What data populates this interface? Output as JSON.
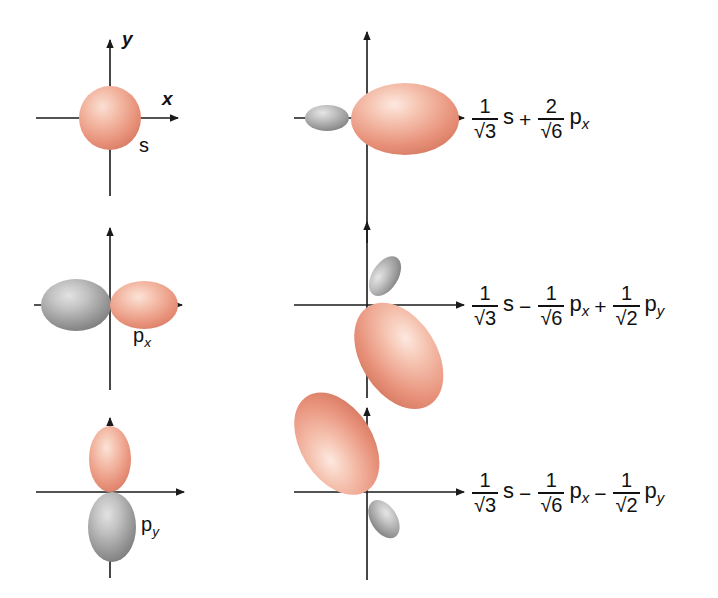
{
  "figure": {
    "background_color": "#ffffff",
    "colors": {
      "positive_lobe": "#e8917a",
      "positive_lobe_light": "#f7cdbd",
      "negative_lobe": "#8f8f8f",
      "negative_lobe_light": "#cfcfcf",
      "axis": "#1a1a1a",
      "text": "#111111"
    }
  },
  "axes": {
    "x_label": "x",
    "y_label": "y"
  },
  "left_column": {
    "panels": [
      {
        "name": "s-orbital",
        "label": "s",
        "label_sub": "",
        "shape": "sphere",
        "lobes": [
          {
            "sign": "positive",
            "color": "#e8917a",
            "direction": "all",
            "size": "medium"
          }
        ]
      },
      {
        "name": "px-orbital",
        "label": "p",
        "label_sub": "x",
        "shape": "dumbbell-horizontal",
        "lobes": [
          {
            "sign": "negative",
            "color": "#8f8f8f",
            "direction": "-x",
            "size": "medium"
          },
          {
            "sign": "positive",
            "color": "#e8917a",
            "direction": "+x",
            "size": "medium"
          }
        ]
      },
      {
        "name": "py-orbital",
        "label": "p",
        "label_sub": "y",
        "shape": "dumbbell-vertical",
        "lobes": [
          {
            "sign": "positive",
            "color": "#e8917a",
            "direction": "+y",
            "size": "medium"
          },
          {
            "sign": "negative",
            "color": "#8f8f8f",
            "direction": "-y",
            "size": "medium"
          }
        ]
      }
    ]
  },
  "right_column": {
    "panels": [
      {
        "name": "hybrid-orbital-1",
        "orientation_degrees": 0,
        "description": "Large positive lobe along +x, small negative lobe along -x",
        "lobes": [
          {
            "sign": "positive",
            "color": "#e8917a",
            "direction": "+x",
            "size": "large"
          },
          {
            "sign": "negative",
            "color": "#8f8f8f",
            "direction": "-x",
            "size": "small"
          }
        ],
        "equation": {
          "terms": [
            {
              "op": "",
              "numerator": "1",
              "denominator": "3",
              "radical": true,
              "orbital": "s",
              "orbital_sub": ""
            },
            {
              "op": "+",
              "numerator": "2",
              "denominator": "6",
              "radical": true,
              "orbital": "p",
              "orbital_sub": "x"
            }
          ]
        }
      },
      {
        "name": "hybrid-orbital-2",
        "orientation_degrees": 210,
        "description": "Large positive lobe pointing down-left, small negative lobe pointing up-right",
        "lobes": [
          {
            "sign": "positive",
            "color": "#e8917a",
            "direction": "down-left",
            "size": "large"
          },
          {
            "sign": "negative",
            "color": "#8f8f8f",
            "direction": "up-right",
            "size": "small"
          }
        ],
        "equation": {
          "terms": [
            {
              "op": "",
              "numerator": "1",
              "denominator": "3",
              "radical": true,
              "orbital": "s",
              "orbital_sub": ""
            },
            {
              "op": "−",
              "numerator": "1",
              "denominator": "6",
              "radical": true,
              "orbital": "p",
              "orbital_sub": "x"
            },
            {
              "op": "+",
              "numerator": "1",
              "denominator": "2",
              "radical": true,
              "orbital": "p",
              "orbital_sub": "y"
            }
          ]
        }
      },
      {
        "name": "hybrid-orbital-3",
        "orientation_degrees": 150,
        "description": "Large positive lobe pointing up-left, small negative lobe pointing down-right",
        "lobes": [
          {
            "sign": "positive",
            "color": "#e8917a",
            "direction": "up-left",
            "size": "large"
          },
          {
            "sign": "negative",
            "color": "#8f8f8f",
            "direction": "down-right",
            "size": "small"
          }
        ],
        "equation": {
          "terms": [
            {
              "op": "",
              "numerator": "1",
              "denominator": "3",
              "radical": true,
              "orbital": "s",
              "orbital_sub": ""
            },
            {
              "op": "−",
              "numerator": "1",
              "denominator": "6",
              "radical": true,
              "orbital": "p",
              "orbital_sub": "x"
            },
            {
              "op": "−",
              "numerator": "1",
              "denominator": "2",
              "radical": true,
              "orbital": "p",
              "orbital_sub": "y"
            }
          ]
        }
      }
    ]
  }
}
